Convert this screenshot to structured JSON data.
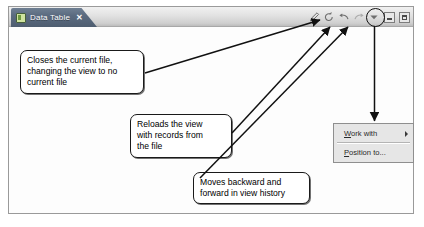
{
  "window": {
    "tab": {
      "label": "Data Table",
      "close_label": "✕",
      "icon": "table-file-icon"
    },
    "toolbar": {
      "icons": [
        {
          "name": "edit-pencil-icon",
          "title": "Edit"
        },
        {
          "name": "refresh-icon",
          "title": "Reload view"
        },
        {
          "name": "back-arrow-icon",
          "title": "Back"
        },
        {
          "name": "forward-arrow-icon",
          "title": "Forward"
        },
        {
          "name": "view-menu-icon",
          "title": "View menu"
        }
      ],
      "minimize_label": "Minimize",
      "maximize_label": "Maximize"
    }
  },
  "menu": {
    "items": [
      {
        "label": "Work with",
        "mnemonic": "W",
        "has_submenu": true
      },
      {
        "label": "Position to...",
        "mnemonic": "P",
        "has_submenu": false
      }
    ]
  },
  "annotations": [
    {
      "id": "callout-close",
      "text": "Closes the current file,\nchanging the view to no\ncurrent file"
    },
    {
      "id": "callout-reload",
      "text": "Reloads the view\nwith records from\nthe file"
    },
    {
      "id": "callout-nav",
      "text": "Moves backward and\nforward in view history"
    }
  ],
  "colors": {
    "tab_active": "#5b6b80",
    "tabstrip": "#e2e2e2",
    "window_border": "#9a9a9a",
    "callout_border": "#1a1a1a",
    "menu_background": "#e6e6e6",
    "arrow": "#111111"
  }
}
